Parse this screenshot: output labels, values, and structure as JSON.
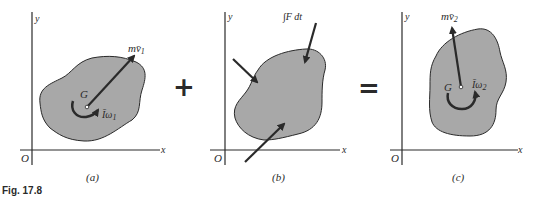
{
  "figure": {
    "caption": "Fig. 17.8",
    "operators": {
      "plus": "+",
      "equals": "="
    },
    "colors": {
      "body_fill": "#a8a8a8",
      "stroke": "#2a2a2a",
      "background": "#ffffff"
    },
    "panels": [
      {
        "id": "a",
        "label": "(a)",
        "axis_x": "x",
        "axis_y": "y",
        "origin": "O",
        "center_label": "G",
        "momentum_label": "mv̄",
        "momentum_sub": "1",
        "angular_label": "Īω",
        "angular_sub": "1"
      },
      {
        "id": "b",
        "label": "(b)",
        "axis_x": "x",
        "axis_y": "y",
        "origin": "O",
        "impulse_label": "∫F dt"
      },
      {
        "id": "c",
        "label": "(c)",
        "axis_x": "x",
        "axis_y": "y",
        "origin": "O",
        "center_label": "G",
        "momentum_label": "mv̄",
        "momentum_sub": "2",
        "angular_label": "Īω",
        "angular_sub": "2"
      }
    ]
  }
}
